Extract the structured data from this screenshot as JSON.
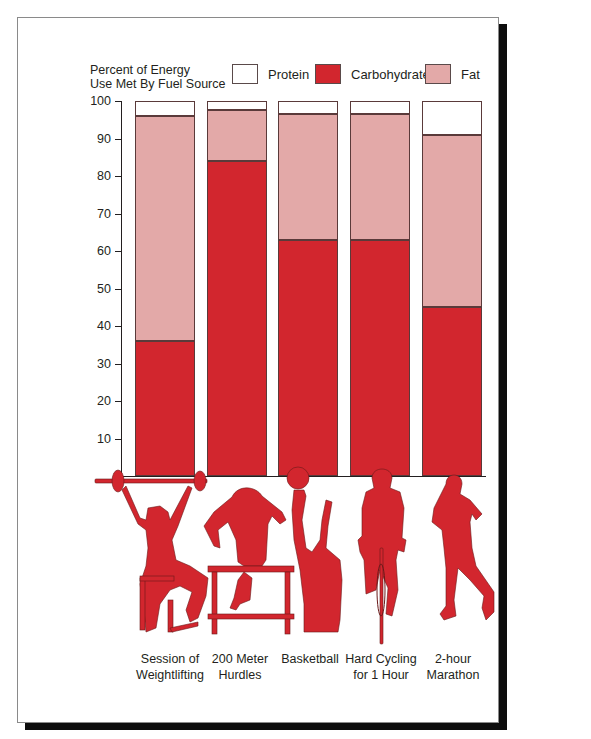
{
  "chart_data": {
    "type": "bar",
    "stacked": true,
    "title": "",
    "ylabel": "Percent of Energy Use Met By Fuel Source",
    "ylabel_lines": [
      "Percent of Energy",
      "Use Met By Fuel Source"
    ],
    "xlabel": "",
    "ylim": [
      0,
      100
    ],
    "yticks": [
      10,
      20,
      30,
      40,
      50,
      60,
      70,
      80,
      90,
      100
    ],
    "grid": false,
    "legend_position": "top",
    "categories": [
      "Session of Weightlifting",
      "200 Meter Hurdles",
      "Basketball",
      "Hard Cycling for 1 Hour",
      "2-hour Marathon"
    ],
    "category_lines": [
      [
        "Session of",
        "Weightlifting"
      ],
      [
        "200 Meter",
        "Hurdles"
      ],
      [
        "Basketball",
        ""
      ],
      [
        "Hard Cycling",
        "for 1 Hour"
      ],
      [
        "2-hour",
        "Marathon"
      ]
    ],
    "series": [
      {
        "name": "Carbohydrate",
        "color": "#d2262e",
        "values": [
          36,
          84,
          63,
          63,
          45
        ]
      },
      {
        "name": "Fat",
        "color": "#e3a9a8",
        "values": [
          60,
          13.5,
          33.5,
          33.5,
          46
        ]
      },
      {
        "name": "Protein",
        "color": "#ffffff",
        "values": [
          4,
          2.5,
          3.5,
          3.5,
          9
        ]
      }
    ],
    "legend": [
      {
        "name": "Protein",
        "color": "#ffffff"
      },
      {
        "name": "Carbohydrate",
        "color": "#d2262e"
      },
      {
        "name": "Fat",
        "color": "#e3a9a8"
      }
    ],
    "annotations": [
      "Silhouette illustrations of athletes: weightlifter, hurdler, basketball player, cyclist, marathon runner"
    ]
  },
  "colors": {
    "carbohydrate": "#d2262e",
    "fat": "#e3a9a8",
    "protein": "#ffffff",
    "silhouette": "#d2262e"
  }
}
